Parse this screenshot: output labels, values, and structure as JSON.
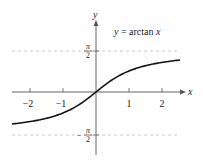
{
  "chart_data": {
    "type": "line",
    "title": "y = arctan x",
    "xlabel": "x",
    "ylabel": "y",
    "xlim": [
      -2.6,
      2.6
    ],
    "ylim": [
      -2.3,
      2.3
    ],
    "x_ticks": [
      -2,
      -1,
      1,
      2
    ],
    "x_tick_labels": [
      "−2",
      "−1",
      "1",
      "2"
    ],
    "y_ticks": [
      1.5708,
      -1.5708
    ],
    "y_tick_labels": [
      "π/2",
      "−π/2"
    ],
    "asymptotes": [
      {
        "y": 1.5708,
        "label": "π/2",
        "style": "dashed"
      },
      {
        "y": -1.5708,
        "label": "−π/2",
        "style": "dashed"
      }
    ],
    "grid": false,
    "legend": null,
    "series": [
      {
        "name": "y = arctan x",
        "x": [
          -2.5,
          -2.0,
          -1.5,
          -1.0,
          -0.5,
          0.0,
          0.5,
          1.0,
          1.5,
          2.0,
          2.5
        ],
        "y": [
          -1.19,
          -1.107,
          -0.983,
          -0.785,
          -0.464,
          0.0,
          0.464,
          0.785,
          0.983,
          1.107,
          1.19
        ]
      }
    ]
  },
  "labels": {
    "equation_lhs": "y",
    "equation_eq": " = arctan ",
    "equation_rhs": "x",
    "x_axis": "x",
    "y_axis": "y",
    "tick_neg2": "−2",
    "tick_neg1": "−1",
    "tick_1": "1",
    "tick_2": "2",
    "pi": "π",
    "two": "2",
    "minus": "−"
  },
  "colors": {
    "curve": "#111111",
    "axis": "#555555",
    "asymptote": "#bbbbbb"
  }
}
